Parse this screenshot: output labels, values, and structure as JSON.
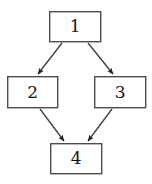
{
  "canvas": {
    "width": 152,
    "height": 184,
    "background": "#ffffff"
  },
  "diagram": {
    "type": "directed-graph",
    "title": "",
    "shape": "diamond",
    "node_style": {
      "shape": "rectangle",
      "fill": "#ffffff",
      "border_color": "#4d4d4d",
      "border_width": 1.4,
      "text_color": "#141414"
    },
    "edge_style": {
      "color": "#3b3b3b",
      "width": 1.3,
      "arrowhead": "filled-triangle",
      "arrowhead_color": "#1f1f1f"
    },
    "nodes": [
      {
        "id": "1",
        "label": "1",
        "x": 49,
        "y": 11,
        "width": 52,
        "height": 31,
        "cx": 75,
        "cy": 26.5
      },
      {
        "id": "2",
        "label": "2",
        "x": 7,
        "y": 76,
        "width": 51,
        "height": 32,
        "cx": 32.5,
        "cy": 92
      },
      {
        "id": "3",
        "label": "3",
        "x": 94,
        "y": 76,
        "width": 52,
        "height": 32,
        "cx": 120,
        "cy": 92
      },
      {
        "id": "4",
        "label": "4",
        "x": 50,
        "y": 143,
        "width": 52,
        "height": 31,
        "cx": 76,
        "cy": 158.5
      }
    ],
    "edges": [
      {
        "id": "e1",
        "from": "1",
        "to": "2",
        "label": "",
        "x1": 62,
        "y1": 43,
        "x2": 38,
        "y2": 74
      },
      {
        "id": "e2",
        "from": "1",
        "to": "3",
        "label": "",
        "x1": 88,
        "y1": 43,
        "x2": 113,
        "y2": 74
      },
      {
        "id": "e3",
        "from": "2",
        "to": "4",
        "label": "",
        "x1": 40,
        "y1": 109,
        "x2": 64,
        "y2": 141
      },
      {
        "id": "e4",
        "from": "3",
        "to": "4",
        "label": "",
        "x1": 112,
        "y1": 109,
        "x2": 88,
        "y2": 141
      }
    ]
  }
}
